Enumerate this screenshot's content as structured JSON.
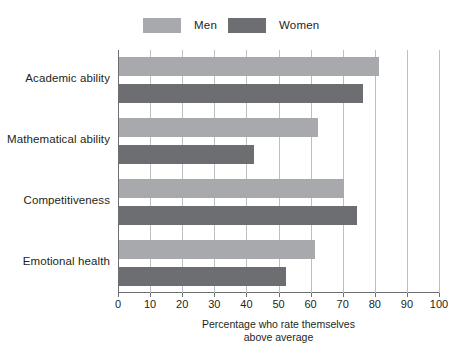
{
  "chart_data": {
    "type": "bar",
    "orientation": "horizontal",
    "title": "",
    "subtitle": "",
    "xlabel": "Percentage who rate themselves above average",
    "xlabel_line1": "Percentage who rate themselves",
    "xlabel_line2": "above average",
    "ylabel": "",
    "categories": [
      "Academic ability",
      "Mathematical ability",
      "Competitiveness",
      "Emotional health"
    ],
    "series": [
      {
        "name": "Men",
        "color": "#a7a9ac",
        "values": [
          81,
          62,
          70,
          61
        ]
      },
      {
        "name": "Women",
        "color": "#6d6e71",
        "values": [
          76,
          42,
          74,
          52
        ]
      }
    ],
    "xlim": [
      0,
      100
    ],
    "xticks": [
      0,
      10,
      20,
      30,
      40,
      50,
      60,
      70,
      80,
      90,
      100
    ],
    "xtick_labels": [
      "0",
      "10",
      "20",
      "30",
      "40",
      "50",
      "60",
      "70",
      "80",
      "90",
      "100"
    ],
    "grid": "vertical",
    "gridline_color": "#bcbec0",
    "axis_color": "#6d6e71",
    "legend": {
      "position": "top",
      "entries": [
        {
          "label": "Men",
          "color": "#a7a9ac"
        },
        {
          "label": "Women",
          "color": "#6d6e71"
        }
      ]
    },
    "background": "#ffffff"
  }
}
